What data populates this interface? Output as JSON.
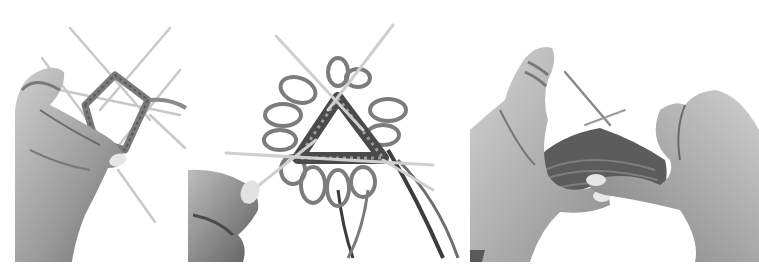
{
  "figure": {
    "background": "#ffffff",
    "palette": {
      "skin_light": "#d8d8d8",
      "skin_mid": "#a8a8a8",
      "skin_dark": "#5a5a5a",
      "yarn": "#6e6e6e",
      "yarn_dark": "#3c3c3c",
      "needle": "#cfcfcf"
    },
    "panels": [
      {
        "id": "p1",
        "subject": "left hand holding four double-pointed needles forming a small square of knitted stitches"
      },
      {
        "id": "p2",
        "subject": "loopy flower-like knitted piece on three double-pointed needles forming a triangle, thumb and forefinger at lower left"
      },
      {
        "id": "p3",
        "subject": "two hands knitting a ribbed tube with yarn wrapped around the left index finger"
      }
    ]
  }
}
